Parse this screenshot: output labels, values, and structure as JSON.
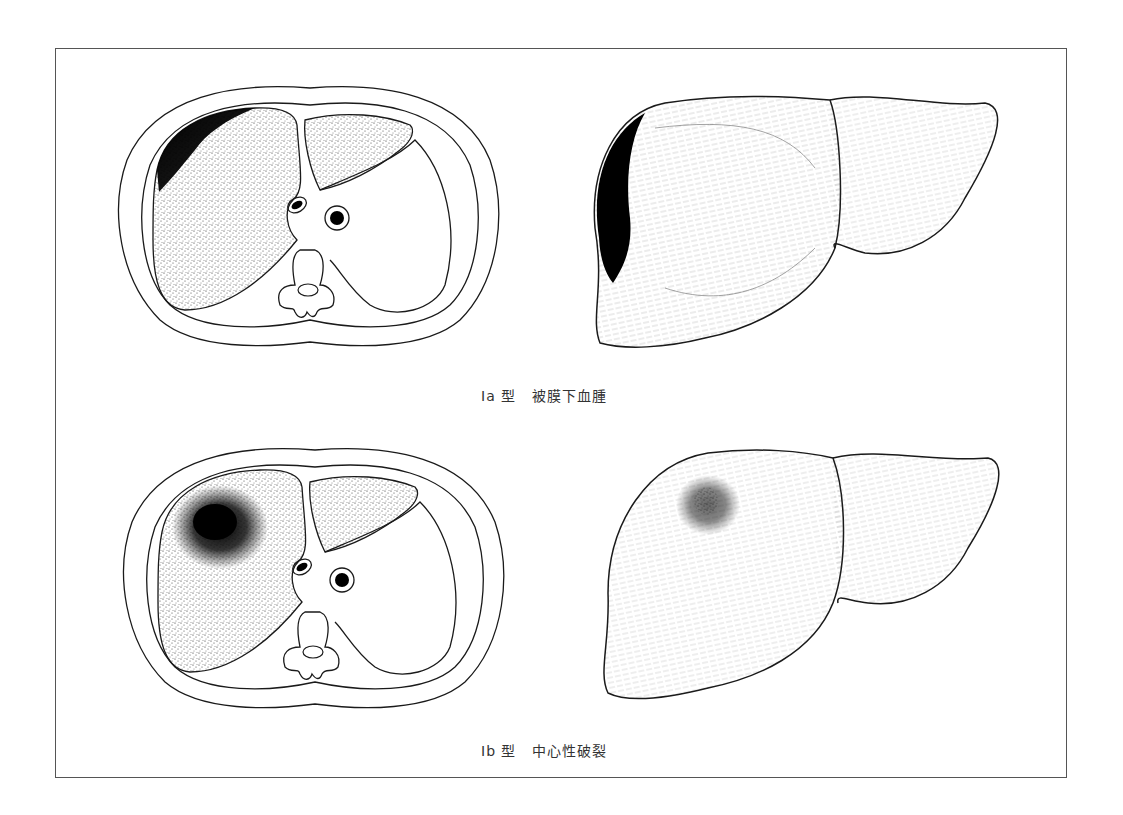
{
  "figure": {
    "panels": [
      {
        "id": "ia",
        "type_label": "Ia 型",
        "description": "被膜下血腫",
        "cross_section_icon": "liver-cross-section-subcapsular-hematoma",
        "surface_view_icon": "liver-surface-subcapsular-hematoma"
      },
      {
        "id": "ib",
        "type_label": "Ib 型",
        "description": "中心性破裂",
        "cross_section_icon": "liver-cross-section-central-rupture",
        "surface_view_icon": "liver-surface-central-rupture"
      }
    ]
  },
  "colors": {
    "line": "#1a1a1a",
    "frame": "#555555",
    "caption": "#333333",
    "background": "#ffffff"
  }
}
